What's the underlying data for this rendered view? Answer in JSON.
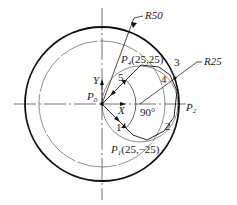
{
  "diagram": {
    "labels": {
      "r50": "R50",
      "r25": "R25",
      "p4": "P",
      "p4_sub": "4",
      "p4_coords": "(25,25)",
      "p1": "P",
      "p1_sub": "1",
      "p1_coords": "(25,−25)",
      "p0": "P",
      "p0_sub": "0",
      "p2": "P",
      "p2_sub": "2",
      "y_axis": "Y",
      "x_axis": "X",
      "angle": "90°"
    },
    "segments": [
      "1",
      "2",
      "3",
      "4",
      "5"
    ]
  }
}
